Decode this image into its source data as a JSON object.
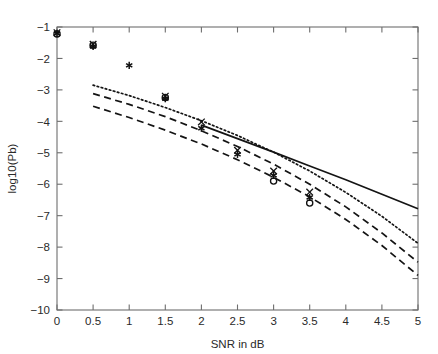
{
  "chart_data": {
    "type": "line",
    "title": "",
    "subtitle": "",
    "xlabel": "SNR in dB",
    "ylabel": "log10(Pb)",
    "xlim": [
      0,
      5
    ],
    "ylim": [
      -10,
      -1
    ],
    "grid": false,
    "legend": "none",
    "xticks": [
      0,
      0.5,
      1,
      1.5,
      2,
      2.5,
      3,
      3.5,
      4,
      4.5,
      5
    ],
    "xticklabels": [
      "0",
      "0.5",
      "1",
      "1.5",
      "2",
      "2.5",
      "3",
      "3.5",
      "4",
      "4.5",
      "5"
    ],
    "yticks": [
      -10,
      -9,
      -8,
      -7,
      -6,
      -5,
      -4,
      -3,
      -2,
      -1
    ],
    "yticklabels": [
      "-10",
      "-9",
      "-8",
      "-7",
      "-6",
      "-5",
      "-4",
      "-3",
      "-2",
      "-1"
    ],
    "box": true,
    "tick_direction": "in",
    "series": [
      {
        "name": "solid-bound",
        "style": "solid",
        "x": [
          2.0,
          2.5,
          3.0,
          3.5,
          4.0,
          4.5,
          5.0
        ],
        "values": [
          -4.12,
          -4.55,
          -4.98,
          -5.42,
          -5.86,
          -6.32,
          -6.78
        ]
      },
      {
        "name": "dotted-bound",
        "style": "dotted",
        "x": [
          0.5,
          1.0,
          1.5,
          2.0,
          2.5,
          3.0,
          3.5,
          4.0,
          4.5,
          5.0
        ],
        "values": [
          -2.85,
          -3.18,
          -3.56,
          -3.98,
          -4.45,
          -4.98,
          -5.58,
          -6.26,
          -7.02,
          -7.88
        ]
      },
      {
        "name": "dashed-bound-upper",
        "style": "dashed",
        "x": [
          0.5,
          1.0,
          1.5,
          2.0,
          2.5,
          3.0,
          3.5,
          4.0,
          4.5,
          5.0
        ],
        "values": [
          -3.12,
          -3.46,
          -3.85,
          -4.3,
          -4.8,
          -5.36,
          -6.0,
          -6.72,
          -7.55,
          -8.48
        ]
      },
      {
        "name": "dashed-bound-lower",
        "style": "dashed",
        "x": [
          0.5,
          1.0,
          1.5,
          2.0,
          2.5,
          3.0,
          3.5,
          4.0,
          4.5,
          5.0
        ],
        "values": [
          -3.52,
          -3.88,
          -4.28,
          -4.72,
          -5.22,
          -5.78,
          -6.4,
          -7.12,
          -7.95,
          -8.9
        ]
      }
    ],
    "marker_series": [
      {
        "name": "simulation-star",
        "marker": "*",
        "x": [
          0,
          0.5,
          1.0,
          1.5,
          2.0,
          2.5,
          3.0,
          3.5
        ],
        "values": [
          -1.2,
          -1.62,
          -2.22,
          -3.28,
          -4.22,
          -5.05,
          -5.72,
          -6.42
        ]
      },
      {
        "name": "simulation-cross",
        "marker": "x",
        "x": [
          0,
          0.5,
          1.5,
          2.0,
          2.5,
          3.0,
          3.5
        ],
        "values": [
          -1.18,
          -1.55,
          -3.2,
          -4.02,
          -4.92,
          -5.58,
          -6.25
        ]
      },
      {
        "name": "simulation-circle",
        "marker": "o",
        "x": [
          0,
          0.5,
          1.5,
          3.0,
          3.5
        ],
        "values": [
          -1.22,
          -1.58,
          -3.24,
          -5.9,
          -6.6
        ]
      }
    ]
  }
}
